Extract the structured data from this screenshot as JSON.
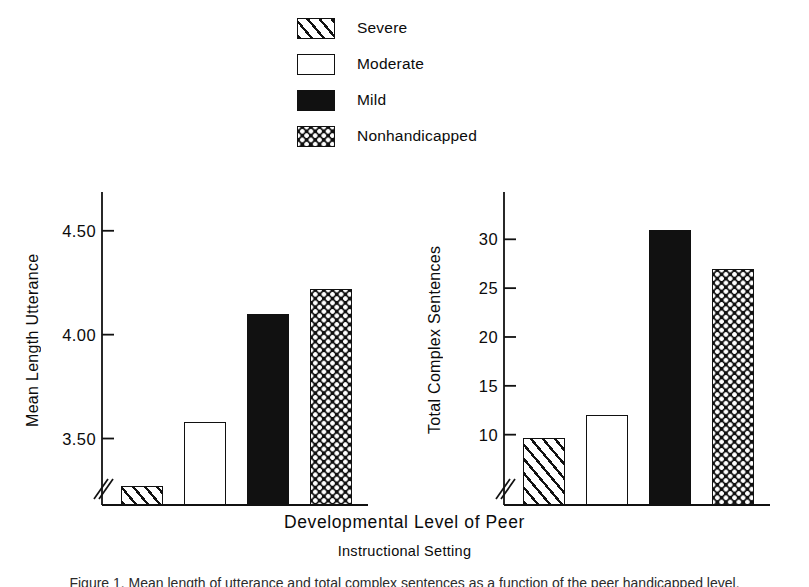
{
  "legend": {
    "items": [
      {
        "label": "Severe",
        "pattern": "hatch"
      },
      {
        "label": "Moderate",
        "pattern": "open"
      },
      {
        "label": "Mild",
        "pattern": "solid"
      },
      {
        "label": "Nonhandicapped",
        "pattern": "check"
      }
    ]
  },
  "xaxis": {
    "title": "Developmental Level of Peer",
    "subtitle": "Instructional Setting"
  },
  "caption": "Figure 1. Mean length of utterance and total complex sentences as a function of the peer handicapped level.",
  "colors": {
    "ink": "#111111",
    "background": "#ffffff"
  },
  "chart_data": [
    {
      "type": "bar",
      "title": "",
      "xlabel": "Developmental Level of Peer Instructional Setting",
      "ylabel": "Mean Length Utterance",
      "categories": [
        "Severe",
        "Moderate",
        "Mild",
        "Nonhandicapped"
      ],
      "values": [
        3.27,
        3.58,
        4.1,
        4.22
      ],
      "ylim": [
        3.18,
        4.6
      ],
      "yticks": [
        3.5,
        4.0,
        4.5
      ],
      "ytick_labels": [
        "3.50",
        "4.00",
        "4.50"
      ],
      "axis_break": true,
      "grid": false,
      "legend": "top-center",
      "patterns": [
        "hatch",
        "open",
        "solid",
        "check"
      ]
    },
    {
      "type": "bar",
      "title": "",
      "xlabel": "Developmental Level of Peer Instructional Setting",
      "ylabel": "Total Complex Sentences",
      "categories": [
        "Severe",
        "Moderate",
        "Mild",
        "Nonhandicapped"
      ],
      "values": [
        9.7,
        12.0,
        31.0,
        27.0
      ],
      "ylim": [
        2.8,
        33.0
      ],
      "yticks": [
        10,
        15,
        20,
        25,
        30
      ],
      "ytick_labels": [
        "10",
        "15",
        "20",
        "25",
        "30"
      ],
      "axis_break": true,
      "grid": false,
      "legend": "top-center",
      "patterns": [
        "hatch",
        "open",
        "solid",
        "check"
      ]
    }
  ]
}
